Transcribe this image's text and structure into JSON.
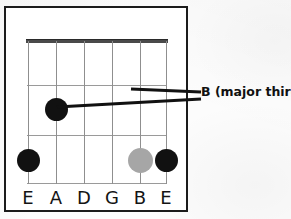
{
  "diagram": {
    "type": "guitar-chord-fretboard",
    "frame": {
      "x": 4,
      "y": 6,
      "width": 184,
      "height": 206,
      "border_color": "#1b1b1b"
    },
    "board": {
      "x": 21,
      "y": 31,
      "width": 140,
      "height": 145
    },
    "nut": {
      "color": "#4a4a4a",
      "thickness": 4
    },
    "fret_line_color": "#9a9a9a",
    "string_line_color": "#8f8f8f",
    "frets_y": [
      0,
      46,
      96,
      144
    ],
    "fret_count": 3,
    "strings_x": [
      1,
      29,
      57,
      85,
      113,
      139
    ],
    "string_labels": [
      "E",
      "A",
      "D",
      "G",
      "B",
      "E"
    ],
    "markers": [
      {
        "name": "marker-a-string-fret2",
        "string_index": 1,
        "x": 29,
        "y": 70,
        "r": 11.5,
        "color": "#111111",
        "style": "filled-black"
      },
      {
        "name": "marker-low-e-open",
        "string_index": 0,
        "x": 1,
        "y": 121,
        "r": 11.5,
        "color": "#111111",
        "style": "filled-black"
      },
      {
        "name": "marker-b-string",
        "string_index": 4,
        "x": 113,
        "y": 121,
        "r": 12.5,
        "color": "#a6a6a6",
        "style": "filled-gray"
      },
      {
        "name": "marker-high-e-string",
        "string_index": 5,
        "x": 139,
        "y": 121,
        "r": 11.5,
        "color": "#111111",
        "style": "filled-black"
      }
    ],
    "leaders": [
      {
        "name": "leader-line-upper",
        "x1": 131,
        "y1": 89,
        "x2": 201,
        "y2": 92
      },
      {
        "name": "leader-line-lower",
        "x1": 57,
        "y1": 107,
        "x2": 201,
        "y2": 99
      }
    ],
    "leader_color": "#111111",
    "leader_width": 3
  },
  "annotation": {
    "label": "B (major third)"
  },
  "chart_data": {
    "type": "diagram",
    "string_labels": [
      "E",
      "A",
      "D",
      "G",
      "B",
      "E"
    ],
    "fret_count": 3,
    "annotations": [
      "B (major third)"
    ],
    "marker_colors": [
      "#111111",
      "#a6a6a6"
    ]
  }
}
